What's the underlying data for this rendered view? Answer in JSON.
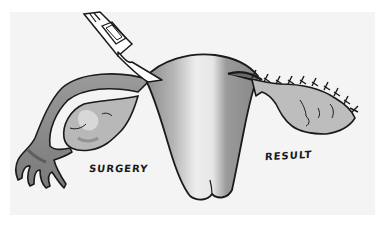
{
  "figure": {
    "type": "medical-illustration",
    "labels": {
      "left": "SURGERY",
      "right": "RESULT"
    },
    "instrument": "scalpel-icon",
    "colors": {
      "background": "#ffffff",
      "panel": "#f4f4f4",
      "outline": "#1a1a1a",
      "shade_dark": "#6e6e6e",
      "shade_mid": "#9c9c9c",
      "shade_light": "#c8c8c8"
    }
  }
}
